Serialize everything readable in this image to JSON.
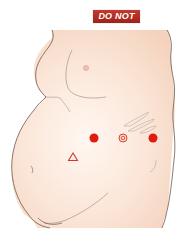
{
  "badge": {
    "label": "DO NOT",
    "color": "#b0281e"
  },
  "illustration": {
    "subject": "side view of abdomen with injection site markers",
    "skin_color": "#f8dccb",
    "outline_color": "#6b5a52",
    "markers": [
      {
        "type": "dot",
        "name": "red-dot-left",
        "x": 94,
        "y": 138,
        "color": "#e01b10"
      },
      {
        "type": "target",
        "name": "navel-target",
        "x": 123,
        "y": 138,
        "color": "#e0402e"
      },
      {
        "type": "dot",
        "name": "red-dot-right",
        "x": 153,
        "y": 138,
        "color": "#e01b10"
      },
      {
        "type": "triangle",
        "name": "triangle-marker",
        "x": 73,
        "y": 157,
        "color": "#d9372a"
      }
    ]
  }
}
